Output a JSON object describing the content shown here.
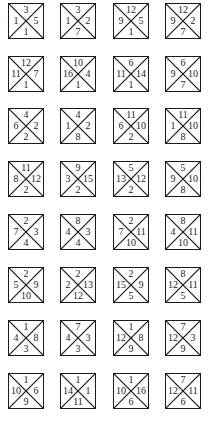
{
  "puzzle": {
    "rows": [
      [
        {
          "top": "3",
          "left": "1",
          "right": "5",
          "bottom": "1"
        },
        {
          "top": "3",
          "left": "1",
          "right": "2",
          "bottom": "7"
        },
        {
          "top": "12",
          "left": "9",
          "right": "5",
          "bottom": "1"
        },
        {
          "top": "12",
          "left": "9",
          "right": "2",
          "bottom": "7"
        }
      ],
      [
        {
          "top": "12",
          "left": "11",
          "right": "7",
          "bottom": "1"
        },
        {
          "top": "10",
          "left": "16",
          "right": "4",
          "bottom": "1"
        },
        {
          "top": "6",
          "left": "11",
          "right": "14",
          "bottom": "1"
        },
        {
          "top": "6",
          "left": "9",
          "right": "10",
          "bottom": "7"
        }
      ],
      [
        {
          "top": "4",
          "left": "6",
          "right": "2",
          "bottom": "2"
        },
        {
          "top": "4",
          "left": "1",
          "right": "2",
          "bottom": "8"
        },
        {
          "top": "11",
          "left": "6",
          "right": "10",
          "bottom": "2"
        },
        {
          "top": "11",
          "left": "1",
          "right": "10",
          "bottom": "8"
        }
      ],
      [
        {
          "top": "11",
          "left": "8",
          "right": "12",
          "bottom": "2"
        },
        {
          "top": "9",
          "left": "3",
          "right": "15",
          "bottom": "2"
        },
        {
          "top": "5",
          "left": "13",
          "right": "12",
          "bottom": "2"
        },
        {
          "top": "5",
          "left": "9",
          "right": "10",
          "bottom": "8"
        }
      ],
      [
        {
          "top": "2",
          "left": "7",
          "right": "3",
          "bottom": "4"
        },
        {
          "top": "8",
          "left": "4",
          "right": "3",
          "bottom": "4"
        },
        {
          "top": "2",
          "left": "7",
          "right": "11",
          "bottom": "10"
        },
        {
          "top": "8",
          "left": "4",
          "right": "11",
          "bottom": "10"
        }
      ],
      [
        {
          "top": "2",
          "left": "5",
          "right": "9",
          "bottom": "10"
        },
        {
          "top": "2",
          "left": "2",
          "right": "13",
          "bottom": "12"
        },
        {
          "top": "2",
          "left": "15",
          "right": "9",
          "bottom": "5"
        },
        {
          "top": "8",
          "left": "12",
          "right": "11",
          "bottom": "5"
        }
      ],
      [
        {
          "top": "1",
          "left": "4",
          "right": "8",
          "bottom": "3"
        },
        {
          "top": "7",
          "left": "4",
          "right": "3",
          "bottom": "3"
        },
        {
          "top": "1",
          "left": "12",
          "right": "8",
          "bottom": "9"
        },
        {
          "top": "7",
          "left": "12",
          "right": "3",
          "bottom": "9"
        }
      ],
      [
        {
          "top": "1",
          "left": "10",
          "right": "6",
          "bottom": "9"
        },
        {
          "top": "1",
          "left": "14",
          "right": "1",
          "bottom": "11"
        },
        {
          "top": "1",
          "left": "10",
          "right": "16",
          "bottom": "6"
        },
        {
          "top": "7",
          "left": "12",
          "right": "11",
          "bottom": "6"
        }
      ]
    ]
  }
}
